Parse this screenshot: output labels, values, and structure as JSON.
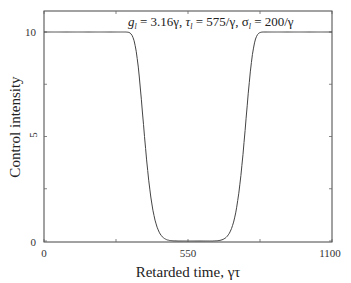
{
  "chart_data": {
    "type": "line",
    "title": "",
    "annotation": "g_l = 3.16γ, τ_l = 575/γ, σ_l = 200/γ",
    "annotation_parts": {
      "g": "g",
      "g_sub": "l",
      "g_val": " = 3.16γ, ",
      "tau": "τ",
      "tau_sub": "l",
      "tau_val": " = 575/γ, ",
      "sigma": "σ",
      "sigma_sub": "l",
      "sigma_val": " = 200/γ"
    },
    "xlabel": "Retarded time, γτ",
    "ylabel": "Control intensity",
    "xlim": [
      0,
      1100
    ],
    "ylim": [
      0,
      11
    ],
    "xticks": [
      0,
      550,
      1100
    ],
    "xtick_labels": [
      "0",
      "550",
      "1100"
    ],
    "yticks": [
      0,
      5,
      10
    ],
    "ytick_labels": [
      "0",
      "5",
      "10"
    ],
    "grid": false,
    "series": [
      {
        "name": "control intensity",
        "x": [
          0,
          100,
          200,
          250,
          300,
          350,
          400,
          450,
          500,
          550,
          600,
          650,
          700,
          750,
          800,
          850,
          900,
          1000,
          1100
        ],
        "values": [
          10,
          10,
          9.9,
          9.4,
          8.0,
          5.5,
          2.8,
          0.7,
          0.05,
          0,
          0.05,
          0.7,
          2.8,
          5.5,
          8.0,
          9.4,
          9.9,
          10,
          10
        ]
      }
    ],
    "model": {
      "center": 575,
      "width": 200,
      "amplitude": 10,
      "order": 8
    }
  }
}
